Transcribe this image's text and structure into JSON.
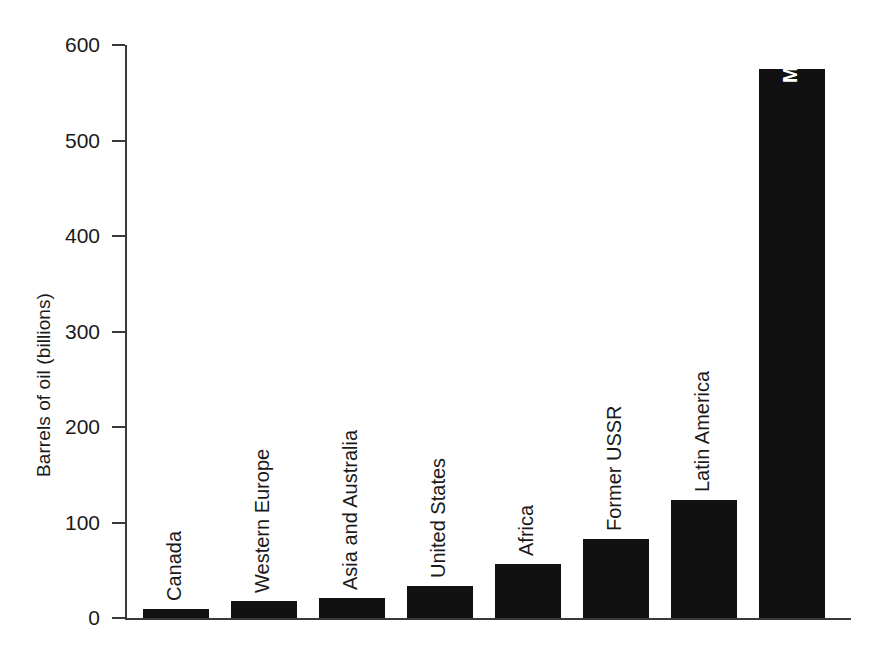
{
  "chart_data": {
    "type": "bar",
    "title": "",
    "xlabel": "",
    "ylabel": "Barrels of oil (billions)",
    "ylim": [
      0,
      600
    ],
    "ytick_labels": [
      "600",
      "500",
      "400",
      "300",
      "200",
      "100",
      "0"
    ],
    "yticks": [
      600,
      500,
      400,
      300,
      200,
      100,
      0
    ],
    "grid": false,
    "legend": "none",
    "orientation": "vertical",
    "bar_color": "#111111",
    "categories": [
      "Canada",
      "Western Europe",
      "Asia and Australia",
      "United States",
      "Africa",
      "Former USSR",
      "Latin America",
      "Middle East"
    ],
    "values": [
      9,
      18,
      21,
      34,
      57,
      83,
      124,
      575
    ],
    "label_placement": [
      "above",
      "above",
      "above",
      "above",
      "above",
      "above",
      "above",
      "inside"
    ],
    "label_colors": [
      "#1a1a1a",
      "#1a1a1a",
      "#1a1a1a",
      "#1a1a1a",
      "#1a1a1a",
      "#1a1a1a",
      "#1a1a1a",
      "#ffffff"
    ]
  }
}
